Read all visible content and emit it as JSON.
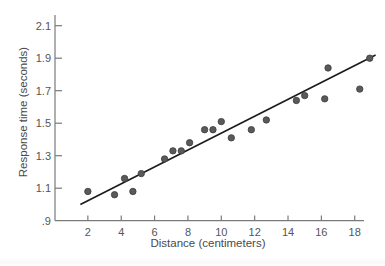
{
  "chart_data": {
    "type": "scatter",
    "title": "",
    "xlabel": "Distance (centimeters)",
    "ylabel": "Response time (seconds)",
    "xlim": [
      0,
      19.5
    ],
    "ylim": [
      0.9,
      2.15
    ],
    "x_ticks": [
      2,
      4,
      6,
      8,
      10,
      12,
      14,
      16,
      18
    ],
    "x_tick_labels": [
      "2",
      "4",
      "6",
      "8",
      "10",
      "12",
      "14",
      "16",
      "18"
    ],
    "y_ticks": [
      0.9,
      1.1,
      1.3,
      1.5,
      1.7,
      1.9,
      2.1
    ],
    "y_tick_labels": [
      ".9",
      "1.1",
      "1.3",
      "1.5",
      "1.7",
      "1.9",
      "2.1"
    ],
    "grid": false,
    "legend": null,
    "series": [
      {
        "name": "observations",
        "points": [
          {
            "x": 2.0,
            "y": 1.08
          },
          {
            "x": 3.6,
            "y": 1.06
          },
          {
            "x": 4.2,
            "y": 1.16
          },
          {
            "x": 4.7,
            "y": 1.08
          },
          {
            "x": 5.2,
            "y": 1.19
          },
          {
            "x": 6.6,
            "y": 1.28
          },
          {
            "x": 7.1,
            "y": 1.33
          },
          {
            "x": 7.6,
            "y": 1.33
          },
          {
            "x": 8.1,
            "y": 1.38
          },
          {
            "x": 9.0,
            "y": 1.46
          },
          {
            "x": 9.5,
            "y": 1.46
          },
          {
            "x": 10.0,
            "y": 1.51
          },
          {
            "x": 10.6,
            "y": 1.41
          },
          {
            "x": 11.8,
            "y": 1.46
          },
          {
            "x": 12.7,
            "y": 1.52
          },
          {
            "x": 14.5,
            "y": 1.64
          },
          {
            "x": 15.0,
            "y": 1.67
          },
          {
            "x": 16.2,
            "y": 1.65
          },
          {
            "x": 16.4,
            "y": 1.84
          },
          {
            "x": 18.3,
            "y": 1.71
          },
          {
            "x": 18.9,
            "y": 1.9
          }
        ]
      }
    ],
    "fit_line": {
      "x1": 1.55,
      "y1": 1.0,
      "x2": 19.25,
      "y2": 1.92
    }
  },
  "colors": {
    "points": "#5a5a5a",
    "fit_line": "#1a1a1a",
    "axes": "#7a7a7a",
    "text": "#555555"
  }
}
